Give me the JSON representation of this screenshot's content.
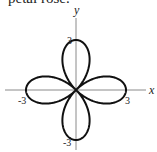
{
  "caption": "petal rose.",
  "chart_data": {
    "type": "line",
    "title": "petal rose.",
    "equation_form": "polar rose, 4 petals along axes",
    "xlabel": "x",
    "ylabel": "y",
    "xlim": [
      -3,
      3
    ],
    "ylim": [
      -3,
      3
    ],
    "tick_labels": {
      "x": [
        "-3",
        "3"
      ],
      "y": [
        "3",
        "-3"
      ]
    },
    "petals": 4,
    "amplitude": 3,
    "grid": false,
    "legend": "none"
  },
  "labels": {
    "x_axis": "x",
    "y_axis": "y",
    "x_neg": "-3",
    "x_pos": "3",
    "y_pos": "3",
    "y_neg": "-3"
  },
  "colors": {
    "curve": "#111111",
    "axis": "#888888"
  }
}
